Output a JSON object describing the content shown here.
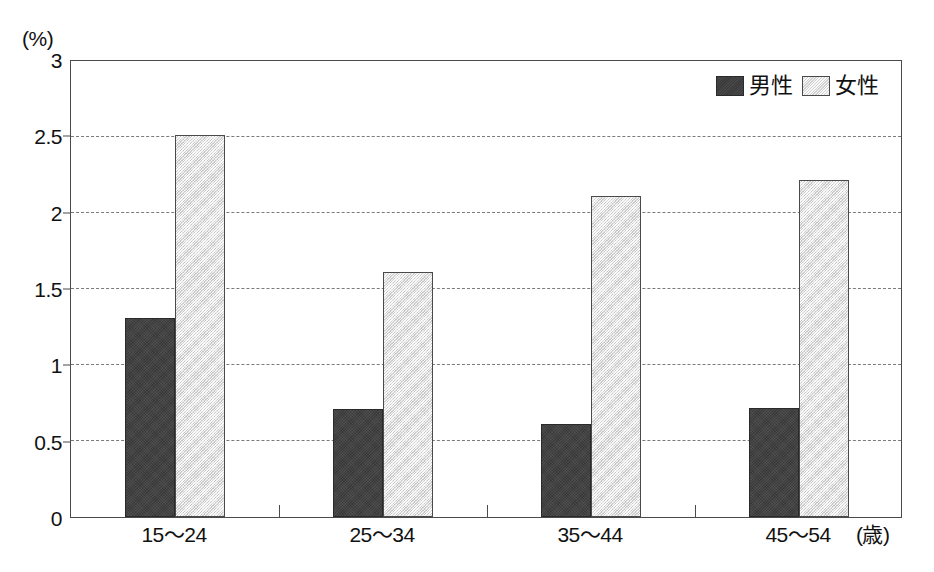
{
  "chart_data": {
    "type": "bar",
    "title": "",
    "subtitle": "",
    "xlabel": "(歳)",
    "ylabel": "(%)",
    "categories": [
      "15～24",
      "25～34",
      "35～44",
      "45～54"
    ],
    "series": [
      {
        "name": "男性",
        "values": [
          1.31,
          0.71,
          0.61,
          0.72
        ],
        "color": "#3d3d3d"
      },
      {
        "name": "女性",
        "values": [
          2.51,
          1.61,
          2.11,
          2.22
        ],
        "color": "#e4e4e4"
      }
    ],
    "ylim": [
      0,
      3
    ],
    "ytick_step": 0.5,
    "ytick_labels": [
      "0",
      "0.5",
      "1",
      "1.5",
      "2",
      "2.5",
      "3"
    ],
    "ytick_values": [
      0,
      0.5,
      1,
      1.5,
      2,
      2.5,
      3
    ],
    "grid": true,
    "grid_style": "dashed",
    "grid_axis": "y",
    "legend_position": "top-right",
    "frame": true
  },
  "axes": {
    "unit_top_left": "(%)",
    "unit_bottom_right": "(歳)"
  },
  "legend": {
    "entries": [
      {
        "label": "男性",
        "swatch": "male-swatch"
      },
      {
        "label": "女性",
        "swatch": "female-swatch"
      }
    ]
  },
  "colors": {
    "male_bar": "#3d3d3d",
    "female_bar": "#e4e4e4",
    "frame": "#4a4a4a",
    "gridline": "#7b7b7b",
    "background": "#ffffff",
    "text": "#111111"
  }
}
